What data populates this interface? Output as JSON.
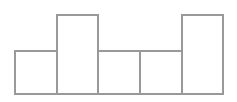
{
  "chart_data": {
    "type": "bar",
    "title": "",
    "xlabel": "",
    "ylabel": "",
    "categories": [
      "1",
      "2",
      "3",
      "4",
      "5"
    ],
    "values": [
      5,
      9,
      5,
      5,
      9
    ],
    "ylim": [
      0,
      9
    ],
    "grid": false,
    "legend": null,
    "style": {
      "fill": "#ffffff",
      "stroke": "#999999"
    }
  }
}
